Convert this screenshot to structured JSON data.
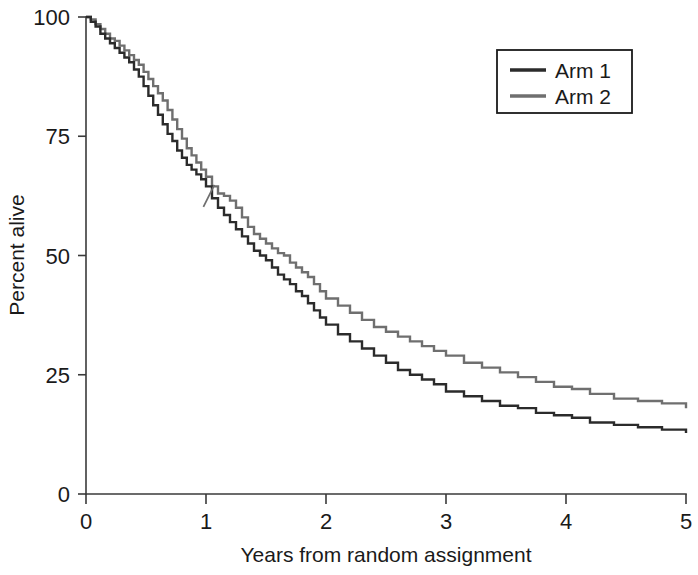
{
  "chart_data": {
    "type": "line",
    "title": "",
    "xlabel": "Years from random assignment",
    "ylabel": "Percent alive",
    "xlim": [
      0,
      5
    ],
    "ylim": [
      0,
      100
    ],
    "xticks": [
      "0",
      "1",
      "2",
      "3",
      "4",
      "5"
    ],
    "yticks": [
      "0",
      "25",
      "50",
      "75",
      "100"
    ],
    "grid": false,
    "legend_position": "top-right",
    "plot_kind": "kaplan-meier-survival-step",
    "series": [
      {
        "name": "Arm 1",
        "color": "#2b2b2b",
        "x": [
          0.0,
          0.04,
          0.08,
          0.12,
          0.16,
          0.2,
          0.24,
          0.28,
          0.32,
          0.36,
          0.4,
          0.44,
          0.48,
          0.52,
          0.56,
          0.6,
          0.64,
          0.68,
          0.72,
          0.76,
          0.8,
          0.84,
          0.88,
          0.92,
          0.96,
          1.0,
          1.05,
          1.1,
          1.15,
          1.2,
          1.25,
          1.3,
          1.35,
          1.4,
          1.45,
          1.5,
          1.55,
          1.6,
          1.65,
          1.7,
          1.75,
          1.8,
          1.85,
          1.9,
          1.95,
          2.0,
          2.1,
          2.2,
          2.3,
          2.4,
          2.5,
          2.6,
          2.7,
          2.8,
          2.9,
          3.0,
          3.15,
          3.3,
          3.45,
          3.6,
          3.75,
          3.9,
          4.05,
          4.2,
          4.4,
          4.6,
          4.8,
          5.0
        ],
        "y": [
          100.0,
          99.0,
          98.0,
          96.5,
          95.5,
          94.5,
          93.5,
          92.5,
          91.5,
          90.5,
          89.0,
          87.5,
          85.5,
          83.5,
          81.5,
          79.5,
          77.5,
          75.5,
          74.0,
          72.0,
          70.5,
          69.0,
          68.0,
          67.0,
          66.0,
          64.5,
          62.0,
          60.0,
          58.5,
          57.0,
          55.5,
          54.0,
          52.5,
          51.0,
          50.0,
          49.0,
          47.5,
          46.0,
          45.0,
          44.0,
          42.5,
          41.5,
          40.0,
          38.5,
          37.0,
          35.5,
          33.5,
          32.0,
          30.5,
          29.0,
          27.5,
          26.0,
          25.0,
          24.0,
          23.0,
          21.5,
          20.5,
          19.5,
          18.5,
          18.0,
          17.0,
          16.5,
          16.0,
          15.0,
          14.5,
          14.0,
          13.5,
          12.8
        ]
      },
      {
        "name": "Arm 2",
        "color": "#6f6f6f",
        "x": [
          0.0,
          0.04,
          0.08,
          0.12,
          0.16,
          0.2,
          0.24,
          0.28,
          0.32,
          0.36,
          0.4,
          0.44,
          0.48,
          0.52,
          0.56,
          0.6,
          0.64,
          0.68,
          0.72,
          0.76,
          0.8,
          0.84,
          0.88,
          0.92,
          0.96,
          1.0,
          1.05,
          1.1,
          1.15,
          1.2,
          1.25,
          1.3,
          1.35,
          1.4,
          1.45,
          1.5,
          1.55,
          1.6,
          1.65,
          1.7,
          1.75,
          1.8,
          1.85,
          1.9,
          1.95,
          2.0,
          2.1,
          2.2,
          2.3,
          2.4,
          2.5,
          2.6,
          2.7,
          2.8,
          2.9,
          3.0,
          3.15,
          3.3,
          3.45,
          3.6,
          3.75,
          3.9,
          4.05,
          4.2,
          4.4,
          4.6,
          4.8,
          5.0
        ],
        "y": [
          100.0,
          99.5,
          98.5,
          97.5,
          96.5,
          95.5,
          95.0,
          94.0,
          93.0,
          92.0,
          91.0,
          90.0,
          88.5,
          87.0,
          85.5,
          84.0,
          82.5,
          80.5,
          78.5,
          76.5,
          74.5,
          72.5,
          71.0,
          69.5,
          68.0,
          66.5,
          64.5,
          63.0,
          62.5,
          61.5,
          60.0,
          58.0,
          56.0,
          54.5,
          53.5,
          52.5,
          51.5,
          50.5,
          50.0,
          48.5,
          47.5,
          46.5,
          45.5,
          44.0,
          42.5,
          41.0,
          39.5,
          38.0,
          36.5,
          35.0,
          34.0,
          33.0,
          32.0,
          31.0,
          30.0,
          29.0,
          27.5,
          26.5,
          25.5,
          24.5,
          23.5,
          22.5,
          22.0,
          21.0,
          20.0,
          19.5,
          19.0,
          18.0
        ]
      }
    ],
    "censor_marks": [
      {
        "series": "Arm 2",
        "x": 1.02,
        "y": 62.5
      }
    ]
  },
  "legend": {
    "items": [
      {
        "label": "Arm 1",
        "color": "#2b2b2b"
      },
      {
        "label": "Arm 2",
        "color": "#6f6f6f"
      }
    ]
  },
  "axes": {
    "x_title": "Years from random assignment",
    "y_title": "Percent alive",
    "x_tick_labels": [
      "0",
      "1",
      "2",
      "3",
      "4",
      "5"
    ],
    "y_tick_labels": [
      "0",
      "25",
      "50",
      "75",
      "100"
    ]
  }
}
